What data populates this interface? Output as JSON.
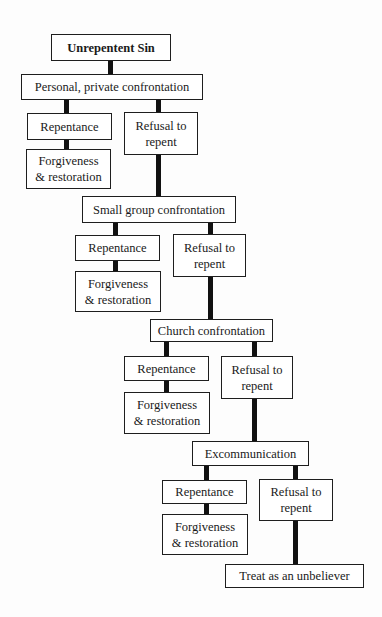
{
  "diagram": {
    "title": "Unrepentent Sin",
    "colors": {
      "border": "#1e1e1e",
      "connector": "#111111",
      "background": "#ffffff",
      "text": "#1a1a1a"
    },
    "nodes": {
      "root": "Unrepentent Sin",
      "step1": "Personal, private confrontation",
      "step2": "Small group confrontation",
      "step3": "Church confrontation",
      "step4": "Excommunication",
      "final": "Treat as an unbeliever"
    },
    "branches": [
      {
        "repentance": "Repentance",
        "refusal_line1": "Refusal to",
        "refusal_line2": "repent",
        "outcome_line1": "Forgiveness",
        "outcome_line2": "& restoration"
      },
      {
        "repentance": "Repentance",
        "refusal_line1": "Refusal to",
        "refusal_line2": "repent",
        "outcome_line1": "Forgiveness",
        "outcome_line2": "& restoration"
      },
      {
        "repentance": "Repentance",
        "refusal_line1": "Refusal to",
        "refusal_line2": "repent",
        "outcome_line1": "Forgiveness",
        "outcome_line2": "& restoration"
      },
      {
        "repentance": "Repentance",
        "refusal_line1": "Refusal to",
        "refusal_line2": "repent",
        "outcome_line1": "Forgiveness",
        "outcome_line2": "& restoration"
      }
    ]
  }
}
